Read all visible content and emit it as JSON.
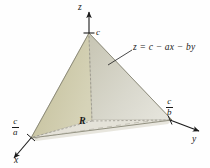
{
  "figure": {
    "kind": "3d-solid-diagram",
    "background_color": "#fefefe",
    "ink_color": "#1a1a1a",
    "description_title": "Tetrahedron bounded by coordinate planes and the plane z = c - ax - by"
  },
  "axes": {
    "z": {
      "label": "z",
      "direction": "up",
      "tick": {
        "label": "c",
        "meaning": "z-intercept"
      }
    },
    "x": {
      "label": "x",
      "direction": "down-left",
      "intercept": {
        "numerator": "c",
        "denominator": "a",
        "text": "c/a"
      }
    },
    "y": {
      "label": "y",
      "direction": "right-down",
      "intercept": {
        "numerator": "c",
        "denominator": "b",
        "text": "c/b"
      }
    }
  },
  "annotations": {
    "surface_equation": "z = c − ax − by",
    "region_label": "R"
  },
  "colors": {
    "face_left": "#c9c5a4",
    "face_left_dark": "#b4b08c",
    "face_right": "#cfcdc0",
    "face_right_light": "#e3e2da",
    "base": "#ddddd6",
    "base_light": "#eceae1",
    "outline": "#8c8a78",
    "axis": "#1a1a1a",
    "dashed": "#9a9a90"
  }
}
